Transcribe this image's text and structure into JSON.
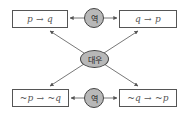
{
  "diagram": {
    "propositions": {
      "original": "p → q",
      "converse": "q → p",
      "inverse": "~p → ~q",
      "contrapositive": "~q → ~p"
    },
    "relations": {
      "converse_top": "역",
      "converse_bottom": "역",
      "contrapositive_center": "대우"
    },
    "colors": {
      "node_fill": "#b8b8b8",
      "border": "#555555",
      "arrow": "#555555",
      "text": "#555555"
    }
  }
}
